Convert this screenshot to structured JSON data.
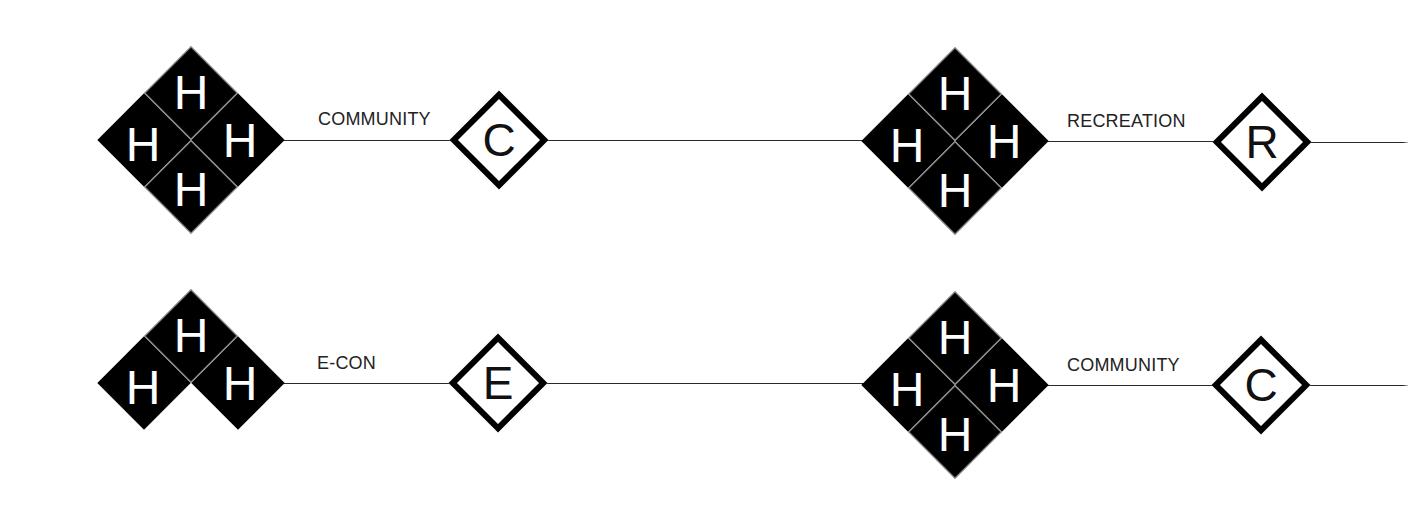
{
  "colors": {
    "background": "#ffffff",
    "hub_fill": "#000000",
    "hub_letter": "#ffffff",
    "hub_divider": "#8a8a8a",
    "node_border": "#000000",
    "line": "#2a2a2a",
    "label": "#222222"
  },
  "rows": [
    {
      "id": "row-1-left",
      "hub": {
        "letter": "H",
        "cells": [
          "top",
          "left",
          "right",
          "bottom"
        ],
        "center": [
          191,
          140
        ]
      },
      "edge_label": "COMMUNITY",
      "node": {
        "letter": "C",
        "center": [
          499,
          140
        ]
      },
      "line_y": 140
    },
    {
      "id": "row-1-right",
      "hub": {
        "letter": "H",
        "cells": [
          "top",
          "left",
          "right",
          "bottom"
        ],
        "center": [
          955,
          141
        ]
      },
      "edge_label": "RECREATION",
      "node": {
        "letter": "R",
        "center": [
          1262,
          142
        ]
      },
      "line_y": 142
    },
    {
      "id": "row-2-left",
      "hub": {
        "letter": "H",
        "cells": [
          "top",
          "left",
          "right"
        ],
        "center": [
          191,
          383
        ]
      },
      "edge_label": "E-CON",
      "node": {
        "letter": "E",
        "center": [
          498,
          383
        ]
      },
      "line_y": 383
    },
    {
      "id": "row-2-right",
      "hub": {
        "letter": "H",
        "cells": [
          "top",
          "left",
          "right",
          "bottom"
        ],
        "center": [
          955,
          385
        ]
      },
      "edge_label": "COMMUNITY",
      "node": {
        "letter": "C",
        "center": [
          1261,
          385
        ]
      },
      "line_y": 385
    }
  ]
}
